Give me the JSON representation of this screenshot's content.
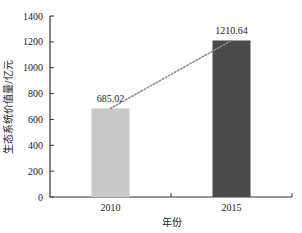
{
  "chart_data": {
    "type": "bar",
    "title": "",
    "categories": [
      "2010",
      "2015"
    ],
    "values": [
      685.02,
      1210.64
    ],
    "value_labels": [
      "685.02",
      "1210.64"
    ],
    "xlabel": "年份",
    "ylabel": "生态系统价值量/亿元",
    "ylim": [
      0,
      1400
    ],
    "yticks": [
      "0",
      "200",
      "400",
      "600",
      "800",
      "1000",
      "1200",
      "1400"
    ],
    "bar_colors": [
      "#c8c8c8",
      "#4a4a4a"
    ],
    "trend_line": {
      "style": "dotted",
      "color": "#8a8a8a",
      "connects": [
        "2010",
        "2015"
      ]
    },
    "grid": false,
    "legend": null
  }
}
